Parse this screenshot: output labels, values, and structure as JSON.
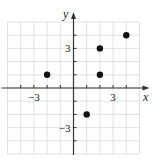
{
  "chart_data": {
    "type": "scatter",
    "title": "",
    "xlabel": "x",
    "ylabel": "y",
    "xlim": [
      -5,
      5
    ],
    "ylim": [
      -5,
      5
    ],
    "grid": true,
    "x_tick_labels": [
      {
        "value": -3,
        "label": "−3"
      },
      {
        "value": 3,
        "label": "3"
      }
    ],
    "y_tick_labels": [
      {
        "value": 3,
        "label": "3"
      },
      {
        "value": -3,
        "label": "−3"
      }
    ],
    "points": [
      {
        "x": -2,
        "y": 1
      },
      {
        "x": 2,
        "y": 3
      },
      {
        "x": 2,
        "y": 1
      },
      {
        "x": 4,
        "y": 4
      },
      {
        "x": 1,
        "y": -2
      }
    ],
    "colors": {
      "grid": "#d9d9d9",
      "axis": "#333333",
      "point": "#111111"
    }
  }
}
